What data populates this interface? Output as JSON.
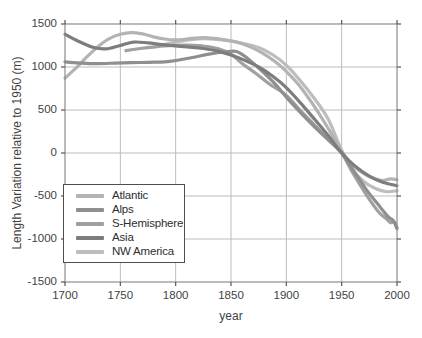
{
  "figure": {
    "background": "#ffffff",
    "text_color": "#3f3f3f",
    "grid_color": "#bcbcbc",
    "border_color": "#8c8c8c",
    "tick_color": "#555555"
  },
  "chart_data": {
    "type": "line",
    "title": "",
    "xlabel": "year",
    "ylabel": "Length Variation relative to 1950 (m)",
    "xlim": [
      1700,
      2000
    ],
    "ylim": [
      -1500,
      1500
    ],
    "xticks": [
      1700,
      1750,
      1800,
      1850,
      1900,
      1950,
      2000
    ],
    "yticks": [
      1500,
      1000,
      500,
      0,
      -500,
      -1000,
      -1500
    ],
    "grid": true,
    "legend_position": "lower-left",
    "series": [
      {
        "name": "NW America",
        "color": "#bdbdbd",
        "points": [
          [
            1787,
            1255
          ],
          [
            1800,
            1290
          ],
          [
            1812,
            1315
          ],
          [
            1825,
            1330
          ],
          [
            1838,
            1320
          ],
          [
            1850,
            1300
          ],
          [
            1862,
            1270
          ],
          [
            1875,
            1225
          ],
          [
            1888,
            1140
          ],
          [
            1900,
            1020
          ],
          [
            1912,
            850
          ],
          [
            1925,
            640
          ],
          [
            1938,
            390
          ],
          [
            1950,
            30
          ],
          [
            1960,
            -200
          ],
          [
            1970,
            -330
          ],
          [
            1980,
            -410
          ],
          [
            1990,
            -450
          ],
          [
            2000,
            -440
          ]
        ]
      },
      {
        "name": "Atlantic",
        "color": "#b3b3b3",
        "points": [
          [
            1700,
            870
          ],
          [
            1710,
            990
          ],
          [
            1720,
            1120
          ],
          [
            1730,
            1240
          ],
          [
            1740,
            1330
          ],
          [
            1750,
            1380
          ],
          [
            1760,
            1400
          ],
          [
            1770,
            1385
          ],
          [
            1780,
            1350
          ],
          [
            1790,
            1325
          ],
          [
            1800,
            1315
          ],
          [
            1810,
            1325
          ],
          [
            1820,
            1340
          ],
          [
            1830,
            1340
          ],
          [
            1840,
            1325
          ],
          [
            1850,
            1305
          ],
          [
            1860,
            1270
          ],
          [
            1870,
            1220
          ],
          [
            1880,
            1150
          ],
          [
            1890,
            1060
          ],
          [
            1900,
            950
          ],
          [
            1910,
            810
          ],
          [
            1920,
            640
          ],
          [
            1930,
            450
          ],
          [
            1940,
            240
          ],
          [
            1950,
            20
          ],
          [
            1960,
            -140
          ],
          [
            1970,
            -240
          ],
          [
            1980,
            -300
          ],
          [
            1988,
            -320
          ],
          [
            1994,
            -300
          ],
          [
            2000,
            -310
          ]
        ]
      },
      {
        "name": "S-Hemisphere",
        "color": "#a0a0a0",
        "points": [
          [
            1755,
            1190
          ],
          [
            1768,
            1215
          ],
          [
            1782,
            1235
          ],
          [
            1796,
            1250
          ],
          [
            1810,
            1255
          ],
          [
            1824,
            1245
          ],
          [
            1838,
            1215
          ],
          [
            1850,
            1150
          ],
          [
            1860,
            1040
          ],
          [
            1872,
            930
          ],
          [
            1885,
            800
          ],
          [
            1900,
            670
          ],
          [
            1913,
            490
          ],
          [
            1926,
            320
          ],
          [
            1939,
            150
          ],
          [
            1950,
            0
          ],
          [
            1960,
            -230
          ],
          [
            1972,
            -480
          ],
          [
            1983,
            -680
          ],
          [
            1990,
            -760
          ],
          [
            1994,
            -810
          ],
          [
            1997,
            -800
          ],
          [
            2000,
            -880
          ]
        ]
      },
      {
        "name": "Alps",
        "color": "#8f8f8f",
        "points": [
          [
            1700,
            1060
          ],
          [
            1715,
            1045
          ],
          [
            1730,
            1040
          ],
          [
            1745,
            1045
          ],
          [
            1760,
            1050
          ],
          [
            1775,
            1055
          ],
          [
            1790,
            1060
          ],
          [
            1800,
            1075
          ],
          [
            1815,
            1110
          ],
          [
            1830,
            1150
          ],
          [
            1845,
            1175
          ],
          [
            1855,
            1180
          ],
          [
            1865,
            1100
          ],
          [
            1880,
            930
          ],
          [
            1890,
            800
          ],
          [
            1900,
            650
          ],
          [
            1912,
            480
          ],
          [
            1925,
            310
          ],
          [
            1938,
            150
          ],
          [
            1950,
            0
          ],
          [
            1960,
            -190
          ],
          [
            1972,
            -420
          ],
          [
            1983,
            -600
          ],
          [
            1992,
            -740
          ],
          [
            1997,
            -790
          ],
          [
            2000,
            -870
          ]
        ]
      },
      {
        "name": "Asia",
        "color": "#7d7d7d",
        "points": [
          [
            1700,
            1380
          ],
          [
            1712,
            1300
          ],
          [
            1725,
            1230
          ],
          [
            1737,
            1210
          ],
          [
            1750,
            1250
          ],
          [
            1762,
            1290
          ],
          [
            1775,
            1280
          ],
          [
            1788,
            1260
          ],
          [
            1800,
            1245
          ],
          [
            1813,
            1230
          ],
          [
            1825,
            1215
          ],
          [
            1838,
            1185
          ],
          [
            1850,
            1140
          ],
          [
            1862,
            1080
          ],
          [
            1875,
            1000
          ],
          [
            1888,
            890
          ],
          [
            1900,
            760
          ],
          [
            1913,
            580
          ],
          [
            1925,
            400
          ],
          [
            1938,
            200
          ],
          [
            1950,
            0
          ],
          [
            1962,
            -150
          ],
          [
            1975,
            -270
          ],
          [
            1987,
            -340
          ],
          [
            2000,
            -380
          ]
        ]
      }
    ]
  },
  "legend": {
    "items": [
      {
        "label": "Atlantic",
        "color": "#b3b3b3"
      },
      {
        "label": "Alps",
        "color": "#8f8f8f"
      },
      {
        "label": "S-Hemisphere",
        "color": "#a0a0a0"
      },
      {
        "label": "Asia",
        "color": "#7d7d7d"
      },
      {
        "label": "NW America",
        "color": "#bdbdbd"
      }
    ]
  }
}
